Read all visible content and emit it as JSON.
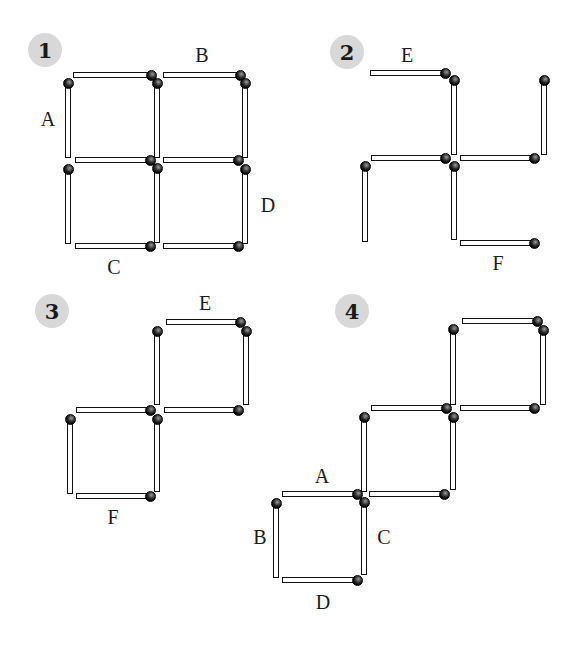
{
  "diagram": {
    "colors": {
      "stick_outline": "#111111",
      "stick_fill": "#ffffff",
      "head": "#000000",
      "badge_bg": "#d8d8d8",
      "text": "#1a1a1a"
    }
  },
  "panels": [
    {
      "id": "1",
      "badge": {
        "text": "1",
        "x": 28,
        "y": 33
      },
      "labels": [
        {
          "text": "A",
          "x": 48,
          "y": 119
        },
        {
          "text": "B",
          "x": 202,
          "y": 55
        },
        {
          "text": "C",
          "x": 114,
          "y": 267
        },
        {
          "text": "D",
          "x": 268,
          "y": 205
        }
      ],
      "sticks": [
        {
          "o": "h",
          "x1": 73,
          "x2": 152,
          "y": 75,
          "head": "end"
        },
        {
          "o": "h",
          "x1": 163,
          "x2": 241,
          "y": 75,
          "head": "end"
        },
        {
          "o": "v",
          "x": 68,
          "y1": 82,
          "y2": 158,
          "head": "start"
        },
        {
          "o": "v",
          "x": 157,
          "y1": 82,
          "y2": 158,
          "head": "start"
        },
        {
          "o": "v",
          "x": 245,
          "y1": 82,
          "y2": 158,
          "head": "start"
        },
        {
          "o": "h",
          "x1": 75,
          "x2": 151,
          "y": 160,
          "head": "end"
        },
        {
          "o": "h",
          "x1": 163,
          "x2": 239,
          "y": 160,
          "head": "end"
        },
        {
          "o": "v",
          "x": 68,
          "y1": 168,
          "y2": 244,
          "head": "start"
        },
        {
          "o": "v",
          "x": 157,
          "y1": 167,
          "y2": 243,
          "head": "start"
        },
        {
          "o": "v",
          "x": 245,
          "y1": 168,
          "y2": 244,
          "head": "start"
        },
        {
          "o": "h",
          "x1": 75,
          "x2": 151,
          "y": 246,
          "head": "end"
        },
        {
          "o": "h",
          "x1": 163,
          "x2": 239,
          "y": 246,
          "head": "end"
        }
      ]
    },
    {
      "id": "2",
      "badge": {
        "text": "2",
        "x": 330,
        "y": 35
      },
      "labels": [
        {
          "text": "E",
          "x": 407,
          "y": 55
        },
        {
          "text": "F",
          "x": 498,
          "y": 263
        }
      ],
      "sticks": [
        {
          "o": "h",
          "x1": 370,
          "x2": 446,
          "y": 73,
          "head": "end"
        },
        {
          "o": "v",
          "x": 454,
          "y1": 79,
          "y2": 155,
          "head": "start"
        },
        {
          "o": "v",
          "x": 544,
          "y1": 79,
          "y2": 155,
          "head": "start"
        },
        {
          "o": "h",
          "x1": 371,
          "x2": 446,
          "y": 158,
          "head": "end"
        },
        {
          "o": "h",
          "x1": 460,
          "x2": 535,
          "y": 158,
          "head": "end"
        },
        {
          "o": "v",
          "x": 365,
          "y1": 165,
          "y2": 242,
          "head": "start"
        },
        {
          "o": "v",
          "x": 454,
          "y1": 165,
          "y2": 240,
          "head": "start"
        },
        {
          "o": "h",
          "x1": 460,
          "x2": 535,
          "y": 243,
          "head": "end"
        }
      ]
    },
    {
      "id": "3",
      "badge": {
        "text": "3",
        "x": 35,
        "y": 294
      },
      "labels": [
        {
          "text": "E",
          "x": 205,
          "y": 303
        },
        {
          "text": "F",
          "x": 113,
          "y": 517
        }
      ],
      "sticks": [
        {
          "o": "h",
          "x1": 166,
          "x2": 241,
          "y": 322,
          "head": "end"
        },
        {
          "o": "v",
          "x": 157,
          "y1": 330,
          "y2": 405,
          "head": "start"
        },
        {
          "o": "v",
          "x": 246,
          "y1": 330,
          "y2": 405,
          "head": "start"
        },
        {
          "o": "h",
          "x1": 76,
          "x2": 151,
          "y": 410,
          "head": "end"
        },
        {
          "o": "h",
          "x1": 164,
          "x2": 239,
          "y": 410,
          "head": "end"
        },
        {
          "o": "v",
          "x": 70,
          "y1": 418,
          "y2": 494,
          "head": "start"
        },
        {
          "o": "v",
          "x": 157,
          "y1": 418,
          "y2": 492,
          "head": "start"
        },
        {
          "o": "h",
          "x1": 76,
          "x2": 151,
          "y": 496,
          "head": "end"
        }
      ]
    },
    {
      "id": "4",
      "badge": {
        "text": "4",
        "x": 335,
        "y": 294
      },
      "labels": [
        {
          "text": "A",
          "x": 322,
          "y": 476
        },
        {
          "text": "B",
          "x": 260,
          "y": 537
        },
        {
          "text": "C",
          "x": 384,
          "y": 537
        },
        {
          "text": "D",
          "x": 323,
          "y": 602
        }
      ],
      "sticks": [
        {
          "o": "h",
          "x1": 462,
          "x2": 538,
          "y": 321,
          "head": "end"
        },
        {
          "o": "v",
          "x": 453,
          "y1": 328,
          "y2": 405,
          "head": "start"
        },
        {
          "o": "v",
          "x": 543,
          "y1": 329,
          "y2": 405,
          "head": "start"
        },
        {
          "o": "h",
          "x1": 371,
          "x2": 447,
          "y": 408,
          "head": "end"
        },
        {
          "o": "h",
          "x1": 460,
          "x2": 535,
          "y": 408,
          "head": "end"
        },
        {
          "o": "v",
          "x": 364,
          "y1": 416,
          "y2": 492,
          "head": "start"
        },
        {
          "o": "v",
          "x": 453,
          "y1": 416,
          "y2": 490,
          "head": "start"
        },
        {
          "o": "h",
          "x1": 282,
          "x2": 358,
          "y": 494,
          "head": "end"
        },
        {
          "o": "h",
          "x1": 369,
          "x2": 445,
          "y": 494,
          "head": "end"
        },
        {
          "o": "v",
          "x": 276,
          "y1": 502,
          "y2": 578,
          "head": "start"
        },
        {
          "o": "v",
          "x": 364,
          "y1": 501,
          "y2": 575,
          "head": "start"
        },
        {
          "o": "h",
          "x1": 282,
          "x2": 358,
          "y": 580,
          "head": "end"
        }
      ]
    }
  ]
}
